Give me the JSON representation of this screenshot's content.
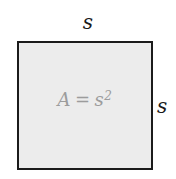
{
  "figure": {
    "shape": "square",
    "side_label_top": "s",
    "side_label_right": "s",
    "formula": {
      "lhs": "A",
      "relation": "=",
      "base": "s",
      "exponent": "2"
    },
    "colors": {
      "background": "#ffffff",
      "square_fill": "#ececec",
      "square_border": "#1b1b1b",
      "side_label_text": "#1a1a1a",
      "formula_text": "#9c9c9c"
    }
  }
}
